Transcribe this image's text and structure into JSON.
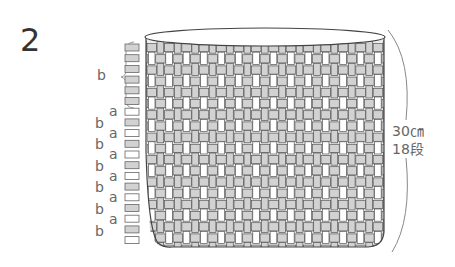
{
  "figure": {
    "number": "2",
    "height_label": "30㎝",
    "rows_label": "18段",
    "top_section_label": "b",
    "row_labels": [
      {
        "label": "a",
        "y": 108
      },
      {
        "label": "b",
        "y": 120
      },
      {
        "label": "a",
        "y": 130
      },
      {
        "label": "b",
        "y": 141
      },
      {
        "label": "a",
        "y": 151
      },
      {
        "label": "b",
        "y": 163
      },
      {
        "label": "a",
        "y": 173
      },
      {
        "label": "b",
        "y": 184
      },
      {
        "label": "a",
        "y": 194
      },
      {
        "label": "b",
        "y": 206
      },
      {
        "label": "a",
        "y": 216
      },
      {
        "label": "b",
        "y": 228
      }
    ],
    "colors": {
      "stroke": "#555555",
      "fill_gray": "#d2d2d2",
      "fill_white": "#ffffff"
    }
  }
}
